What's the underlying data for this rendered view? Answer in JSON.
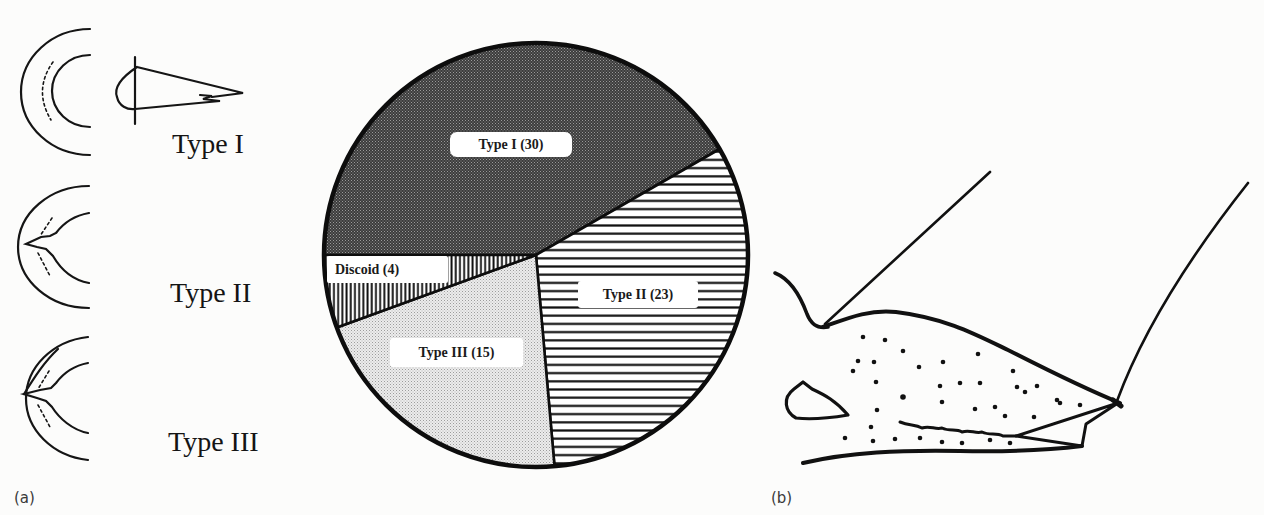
{
  "figure": {
    "panel_a_label": "(a)",
    "panel_b_label": "(b)",
    "type_diagrams": [
      {
        "label": "Type I"
      },
      {
        "label": "Type II"
      },
      {
        "label": "Type III"
      }
    ]
  },
  "chart_data": {
    "type": "pie",
    "title": "",
    "categories": [
      "Type I",
      "Type II",
      "Type III",
      "Discoid"
    ],
    "values": [
      30,
      23,
      15,
      4
    ],
    "slice_labels": [
      "Type I (30)",
      "Type II (23)",
      "Type III (15)",
      "Discoid (4)"
    ],
    "fills": [
      "dark-stipple",
      "horizontal-lines",
      "light-stipple",
      "vertical-lines"
    ],
    "start_angle_deg": 180,
    "direction": "clockwise",
    "legend": "none (labels inside slices)",
    "xlabel": "",
    "ylabel": ""
  }
}
